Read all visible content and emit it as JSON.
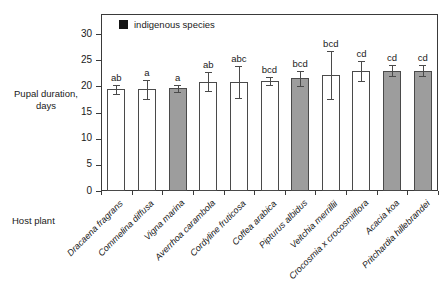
{
  "chart_data": {
    "type": "bar",
    "title": "",
    "subtitle": "",
    "xlabel": "Host plant",
    "ylabel": "Pupal duration,\ndays",
    "ylabel_lines": [
      "Pupal",
      "duration,",
      "days"
    ],
    "ylim": [
      0,
      30
    ],
    "yticks": [
      0,
      5,
      10,
      15,
      20,
      25,
      30
    ],
    "ytick_labels": [
      "0",
      "5",
      "10",
      "15",
      "20",
      "25",
      "30"
    ],
    "grid": false,
    "legend": {
      "position": "top-left-inside",
      "entries": [
        {
          "label": "indigenous species",
          "color": "#141414",
          "marker": "filled-square"
        }
      ]
    },
    "categories": [
      "Dracaena fragrans",
      "Commelina diffusa",
      "Vigna marina",
      "Averrhoa carambola",
      "Cordyline fruticosa",
      "Coffea arabica",
      "Pipturus albidus",
      "Veitchia merrillii",
      "Crocosmia x crocosmiiflora",
      "Acacia koa",
      "Pritchardia hillebrandei"
    ],
    "values": [
      19.4,
      19.4,
      19.6,
      20.9,
      20.8,
      21.0,
      21.5,
      22.1,
      23.0,
      23.0,
      23.0
    ],
    "err_low": [
      0.8,
      1.9,
      0.6,
      1.8,
      3.0,
      0.7,
      1.4,
      4.6,
      1.9,
      1.0,
      1.1
    ],
    "err_high": [
      0.8,
      1.9,
      0.6,
      1.8,
      3.0,
      0.7,
      1.4,
      4.6,
      1.9,
      1.0,
      1.1
    ],
    "indigenous": [
      false,
      false,
      true,
      false,
      false,
      false,
      true,
      false,
      false,
      true,
      true
    ],
    "annotations": [
      "ab",
      "a",
      "a",
      "ab",
      "abc",
      "bcd",
      "bcd",
      "bcd",
      "cd",
      "cd",
      "cd"
    ],
    "bar_fill_introduced": "#ffffff",
    "bar_fill_indigenous": "#9d9d9d",
    "bar_edge_color": "#4a4a4a",
    "axis_color": "#3a3a3a"
  }
}
